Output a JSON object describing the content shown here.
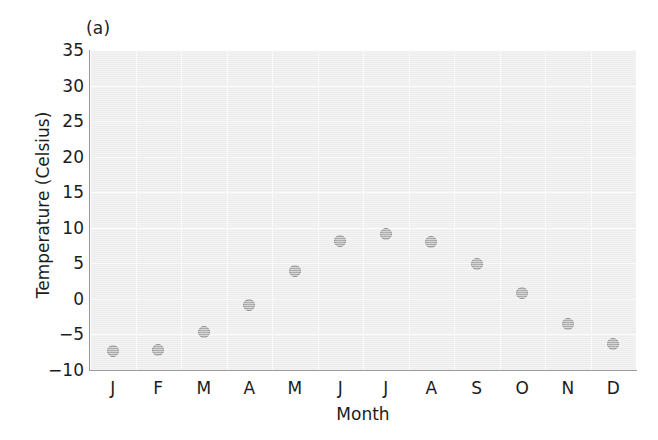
{
  "figure": {
    "panel_label": "(a)",
    "background_color": "#ffffff",
    "plot_background_color": "#ededed",
    "gridline_color": "#fbfbfb",
    "marker_fill_color": "#adadad",
    "marker_edge_color": "#8e8e8e",
    "axis_color": "#9a9a9a",
    "text_color": "#1c1c1c"
  },
  "chart_data": {
    "type": "scatter",
    "title": "(a)",
    "xlabel": "Month",
    "ylabel": "Temperature (Celsius)",
    "categories": [
      "J",
      "F",
      "M",
      "A",
      "M",
      "J",
      "J",
      "A",
      "S",
      "O",
      "N",
      "D"
    ],
    "category_full_names": [
      "January",
      "February",
      "March",
      "April",
      "May",
      "June",
      "July",
      "August",
      "September",
      "October",
      "November",
      "December"
    ],
    "values": [
      -7.3,
      -7.2,
      -4.7,
      -0.9,
      3.9,
      8.1,
      9.1,
      8.0,
      4.9,
      0.8,
      -3.6,
      -6.3
    ],
    "ylim": [
      -10,
      35
    ],
    "yticks": [
      35,
      30,
      25,
      20,
      15,
      10,
      5,
      0,
      -5,
      -10
    ],
    "ytick_labels": [
      "35",
      "30",
      "25",
      "20",
      "15",
      "10",
      "5",
      "0",
      "−5",
      "−10"
    ],
    "xlim": [
      0.5,
      12.5
    ],
    "grid": true,
    "legend": false,
    "legend_position": "none",
    "series": [
      {
        "name": "Monthly mean temperature",
        "marker": "circle",
        "values": [
          -7.3,
          -7.2,
          -4.7,
          -0.9,
          3.9,
          8.1,
          9.1,
          8.0,
          4.9,
          0.8,
          -3.6,
          -6.3
        ]
      }
    ]
  }
}
